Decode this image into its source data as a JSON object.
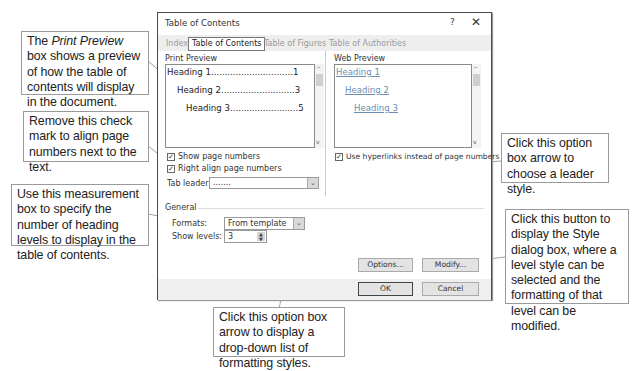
{
  "callouts": {
    "print_preview": {
      "pre": "The ",
      "em": "Print Preview",
      "post": " box shows a preview of how the table of contents will display in the document."
    },
    "right_align": "Remove this check mark to align page numbers next to the text.",
    "show_levels": "Use this measurement box to specify the number of heading levels to display in the table of contents.",
    "tab_leader": "Click this option box arrow to choose a leader style.",
    "modify": "Click this button to display the Style dialog box, where a level style can be selected and the formatting of that level can be modified.",
    "formats": "Click this option box arrow to display a drop-down list of formatting styles."
  },
  "dialog": {
    "title": "Table of Contents",
    "help_glyph": "?",
    "close_glyph": "✕",
    "tabs": [
      {
        "label": "Index",
        "active": false
      },
      {
        "label": "Table of Contents",
        "active": true
      },
      {
        "label": "Table of Figures",
        "active": false
      },
      {
        "label": "Table of Authorities",
        "active": false
      }
    ],
    "print_preview": {
      "label": "Print Preview",
      "lines": [
        {
          "text": "Heading 1",
          "dots": "..............................",
          "page": "1"
        },
        {
          "text": "Heading 2",
          "dots": "...........................",
          "page": "3"
        },
        {
          "text": "Heading 3",
          "dots": ".........................",
          "page": "5"
        }
      ]
    },
    "web_preview": {
      "label": "Web Preview",
      "lines": [
        "Heading 1",
        "Heading 2",
        "Heading 3"
      ]
    },
    "show_page_numbers": {
      "label": "Show page numbers",
      "checked": true
    },
    "right_align_page_numbers": {
      "label": "Right align page numbers",
      "checked": true
    },
    "use_hyperlinks": {
      "label": "Use hyperlinks instead of page numbers",
      "checked": true
    },
    "tab_leader": {
      "label": "Tab leader:",
      "value": "......."
    },
    "general": {
      "label": "General",
      "formats": {
        "label": "Formats:",
        "value": "From template"
      },
      "show_levels": {
        "label": "Show levels:",
        "value": "3"
      }
    },
    "buttons": {
      "options": "Options...",
      "modify": "Modify...",
      "ok": "OK",
      "cancel": "Cancel"
    },
    "glyphs": {
      "up": "^",
      "down": "v",
      "chevron": "⌄",
      "check": "✓"
    }
  }
}
